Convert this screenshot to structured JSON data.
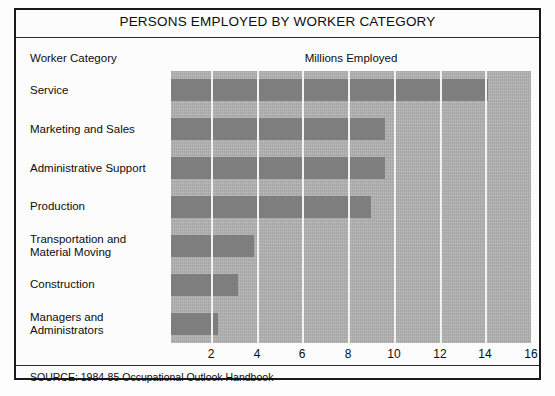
{
  "figure": {
    "title": "PERSONS EMPLOYED BY WORKER CATEGORY",
    "category_header": "Worker Category",
    "value_header": "Millions Employed",
    "source": "SOURCE: 1984-85 Occupational Outlook Handbook",
    "colors": {
      "bar": "#818181",
      "plot_background": "#b2b2b2",
      "gridline": "#f2f2f2",
      "frame": "#1a1a1a",
      "text": "#0d0d0d"
    }
  },
  "chart_data": {
    "type": "bar",
    "orientation": "horizontal",
    "title": "PERSONS EMPLOYED BY WORKER CATEGORY",
    "xlabel": "Millions Employed",
    "ylabel": "Worker Category",
    "xlim": [
      0,
      16
    ],
    "xticks": [
      2,
      4,
      6,
      8,
      10,
      12,
      14,
      16
    ],
    "grid": true,
    "legend": "none",
    "categories": [
      "Service",
      "Marketing and Sales",
      "Administrative Support",
      "Production",
      "Transportation and Material Moving",
      "Construction",
      "Managers and Administrators"
    ],
    "category_lines": [
      [
        "Service"
      ],
      [
        "Marketing and Sales"
      ],
      [
        "Administrative Support"
      ],
      [
        "Production"
      ],
      [
        "Transportation and",
        "Material Moving"
      ],
      [
        "Construction"
      ],
      [
        "Managers and",
        "Administrators"
      ]
    ],
    "values": [
      14.1,
      9.6,
      9.6,
      9.0,
      3.9,
      3.2,
      2.3
    ],
    "units": "millions"
  }
}
